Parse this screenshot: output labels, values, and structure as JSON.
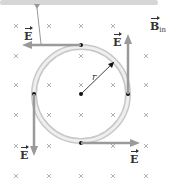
{
  "diagram": {
    "field_label": "B",
    "field_subscript": "in",
    "radius_label": "r",
    "e_label": "E",
    "colors": {
      "arrow": "#9a9a9a",
      "ring_outer": "#cfcfcf",
      "ring_inner": "#f2f2f2",
      "cross": "#a8a8a8",
      "dot": "#111111",
      "bar": "#d6d6d6"
    },
    "labels": {
      "e_left_top": "E",
      "e_right_top": "E",
      "e_left_bottom": "E",
      "e_right_bottom": "E",
      "b": "B",
      "b_sub": "in",
      "r": "r"
    }
  }
}
